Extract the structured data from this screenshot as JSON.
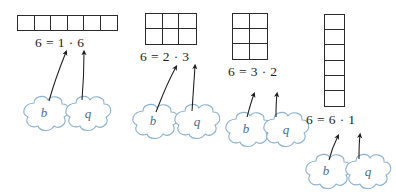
{
  "figure": {
    "number_factored": 6,
    "cloud_labels": {
      "left": "b",
      "right": "q"
    }
  },
  "groups": [
    {
      "id": "group-1-by-6",
      "rows": 1,
      "cols": 6,
      "equation": "6 = 1 · 6",
      "left_factor": 1,
      "right_factor": 6,
      "clouds": [
        {
          "label": "b",
          "points_to": "left_factor"
        },
        {
          "label": "q",
          "points_to": "right_factor"
        }
      ]
    },
    {
      "id": "group-2-by-3",
      "rows": 2,
      "cols": 3,
      "equation": "6 = 2 · 3",
      "left_factor": 2,
      "right_factor": 3,
      "clouds": [
        {
          "label": "b",
          "points_to": "left_factor"
        },
        {
          "label": "q",
          "points_to": "right_factor"
        }
      ]
    },
    {
      "id": "group-3-by-2",
      "rows": 3,
      "cols": 2,
      "equation": "6 = 3 · 2",
      "left_factor": 3,
      "right_factor": 2,
      "clouds": [
        {
          "label": "b",
          "points_to": "left_factor"
        },
        {
          "label": "q",
          "points_to": "right_factor"
        }
      ]
    },
    {
      "id": "group-6-by-1",
      "rows": 6,
      "cols": 1,
      "equation": "6 = 6 · 1",
      "left_factor": 6,
      "right_factor": 1,
      "clouds": [
        {
          "label": "b",
          "points_to": "left_factor"
        },
        {
          "label": "q",
          "points_to": "right_factor"
        }
      ]
    }
  ],
  "colors": {
    "grid_line": "#2b2b2b",
    "text": "#1c1c1c",
    "cloud_outline": "#8ab0d0",
    "cloud_letter": "#4a6d92",
    "arrow": "#1c1c1c",
    "background": "#ffffff"
  }
}
